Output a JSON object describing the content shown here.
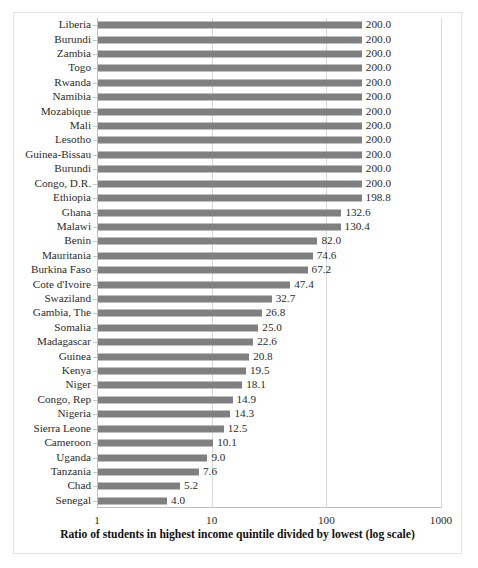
{
  "chart_data": {
    "type": "bar",
    "orientation": "horizontal",
    "title": "",
    "subtitle": "",
    "xlabel": "Ratio of students in highest income quintile divided by lowest (log scale)",
    "ylabel": "",
    "xscale": "log",
    "xlim": [
      1,
      1000
    ],
    "xticks": [
      1,
      10,
      100,
      1000
    ],
    "xtick_labels": [
      "1",
      "10",
      "100",
      "1000"
    ],
    "grid": true,
    "grid_axis": "x",
    "legend": null,
    "bar_color": "#808080",
    "value_label_format": "one-decimal",
    "categories": [
      "Liberia",
      "Burundi",
      "Zambia",
      "Togo",
      "Rwanda",
      "Namibia",
      "Mozabique",
      "Mali",
      "Lesotho",
      "Guinea-Bissau",
      "Burundi",
      "Congo, D.R.",
      "Ethiopia",
      "Ghana",
      "Malawi",
      "Benin",
      "Mauritania",
      "Burkina Faso",
      "Cote d'Ivoire",
      "Swaziland",
      "Gambia, The",
      "Somalia",
      "Madagascar",
      "Guinea",
      "Kenya",
      "Niger",
      "Congo, Rep",
      "Nigeria",
      "Sierra Leone",
      "Cameroon",
      "Uganda",
      "Tanzania",
      "Chad",
      "Senegal"
    ],
    "values": [
      200.0,
      200.0,
      200.0,
      200.0,
      200.0,
      200.0,
      200.0,
      200.0,
      200.0,
      200.0,
      200.0,
      200.0,
      198.8,
      132.6,
      130.4,
      82.0,
      74.6,
      67.2,
      47.4,
      32.7,
      26.8,
      25.0,
      22.6,
      20.8,
      19.5,
      18.1,
      14.9,
      14.3,
      12.5,
      10.1,
      9.0,
      7.6,
      5.2,
      4.0
    ],
    "value_labels": [
      "200.0",
      "200.0",
      "200.0",
      "200.0",
      "200.0",
      "200.0",
      "200.0",
      "200.0",
      "200.0",
      "200.0",
      "200.0",
      "200.0",
      "198.8",
      "132.6",
      "130.4",
      "82.0",
      "74.6",
      "67.2",
      "47.4",
      "32.7",
      "26.8",
      "25.0",
      "22.6",
      "20.8",
      "19.5",
      "18.1",
      "14.9",
      "14.3",
      "12.5",
      "10.1",
      "9.0",
      "7.6",
      "5.2",
      "4.0"
    ]
  },
  "colors": {
    "bar": "#808080",
    "gridline": "#d9d9d9",
    "axis": "#bfbfbf",
    "frame": "#e3e3e3",
    "text": "#2b2b2b",
    "background": "#ffffff"
  }
}
